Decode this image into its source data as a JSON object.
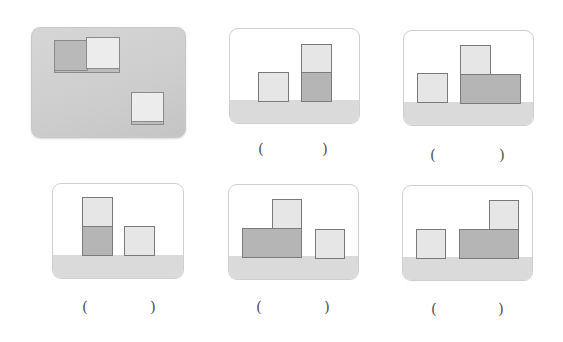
{
  "figure": {
    "reference_panel": {
      "description": "Top-left reference image: two adjacent cubes (dark + light) and one separate light cube, shown in perspective",
      "blocks": [
        {
          "shade": "dark",
          "role": "cube"
        },
        {
          "shade": "light",
          "role": "cube"
        },
        {
          "shade": "light",
          "role": "cube"
        }
      ]
    },
    "options": [
      {
        "id": "option-a",
        "answer_paren_open": "(",
        "answer_paren_close": ")",
        "arrangement": "single light cube left; stack of dark cube with light cube on top at right"
      },
      {
        "id": "option-b",
        "answer_paren_open": "(",
        "answer_paren_close": ")",
        "arrangement": "single light cube left; wide dark block with light cube on top-left at right"
      },
      {
        "id": "option-c",
        "answer_paren_open": "(",
        "answer_paren_close": ")",
        "arrangement": "stack of dark cube with light cube on top at left; single light cube right"
      },
      {
        "id": "option-d",
        "answer_paren_open": "(",
        "answer_paren_close": ")",
        "arrangement": "wide dark block with light cube on top-right at left; single light cube right"
      },
      {
        "id": "option-e",
        "answer_paren_open": "(",
        "answer_paren_close": ")",
        "arrangement": "single light cube left; wide dark block with light cube on top-right at right"
      }
    ],
    "colors": {
      "light_block": "#e6e6e6",
      "dark_block": "#b5b5b5",
      "floor": "#dadada",
      "outline": "#7a7a7a",
      "panel_border": "#cfcfcf"
    }
  }
}
